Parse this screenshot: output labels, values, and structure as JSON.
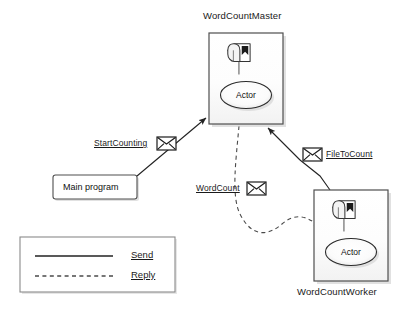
{
  "diagram": {
    "title_master": "WordCountMaster",
    "title_worker": "WordCountWorker",
    "nodes": {
      "master": {
        "label": "WordCountMaster",
        "actor_label": "Actor",
        "mailbox_icon": "mailbox-icon",
        "x": 209,
        "y": 33,
        "w": 74,
        "h": 91
      },
      "worker": {
        "label": "WordCountWorker",
        "actor_label": "Actor",
        "mailbox_icon": "mailbox-icon",
        "x": 314,
        "y": 190,
        "w": 74,
        "h": 91
      },
      "main_program": {
        "label": "Main program",
        "x": 53,
        "y": 175,
        "w": 84,
        "h": 24
      }
    },
    "messages": [
      {
        "name": "start-counting",
        "label": "StartCounting",
        "icon": "envelope-icon",
        "icon_side": "right",
        "kind": "send"
      },
      {
        "name": "file-to-count",
        "label": "FileToCount",
        "icon": "envelope-icon",
        "icon_side": "left",
        "kind": "send"
      },
      {
        "name": "word-count",
        "label": "WordCount",
        "icon": "envelope-icon",
        "icon_side": "right",
        "kind": "reply"
      }
    ],
    "legend": {
      "send_label": "Send",
      "reply_label": "Reply",
      "x": 20,
      "y": 237,
      "w": 155,
      "h": 55
    },
    "colors": {
      "stroke": "#222222",
      "box_fill": "#ffffff",
      "box_border": "#555555",
      "shadow": "#bdbdbd",
      "text": "#111111"
    }
  }
}
